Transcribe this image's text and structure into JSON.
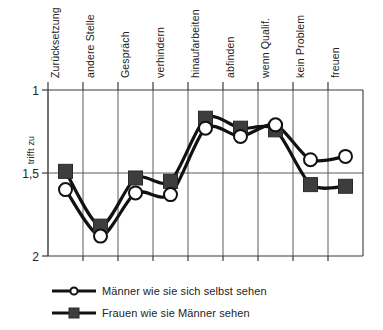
{
  "chart_data": {
    "type": "line",
    "title": "",
    "xlabel": "",
    "ylabel": "trifft zu",
    "ylim": [
      1,
      2
    ],
    "y_inverted": true,
    "grid": true,
    "legend_position": "bottom-left",
    "yticks": [
      "1",
      "1,5",
      "2"
    ],
    "ytick_values": [
      1,
      1.5,
      2
    ],
    "categories": [
      "Zurücksetzung",
      "andere Stelle",
      "Gespräch",
      "verhindern",
      "hinaufarbeiten",
      "abfinden",
      "wenn Qualif.",
      "kein Problem",
      "freuen"
    ],
    "series": [
      {
        "name": "Männer wie sie sich selbst sehen",
        "marker": "circle",
        "color": "#111111",
        "values": [
          1.6,
          1.88,
          1.62,
          1.63,
          1.23,
          1.28,
          1.21,
          1.42,
          1.4
        ]
      },
      {
        "name": "Frauen wie sie Männer sehen",
        "marker": "square",
        "color": "#3d3d3d",
        "values": [
          1.49,
          1.82,
          1.53,
          1.55,
          1.17,
          1.23,
          1.24,
          1.57,
          1.58
        ]
      }
    ]
  },
  "axis": {
    "y_title": "trifft zu",
    "y_tick_top": "1",
    "y_tick_mid": "1,5",
    "y_tick_bottom": "2"
  },
  "legend": {
    "items": [
      {
        "label": "Männer wie sie sich selbst sehen",
        "marker": "circle"
      },
      {
        "label": "Frauen wie sie Männer sehen",
        "marker": "square"
      }
    ]
  },
  "colors": {
    "line": "#111111",
    "square_marker": "#3d3d3d",
    "circle_marker_fill": "#ffffff",
    "grid": "#4a4a4a",
    "text": "#232323",
    "background": "#ffffff"
  }
}
